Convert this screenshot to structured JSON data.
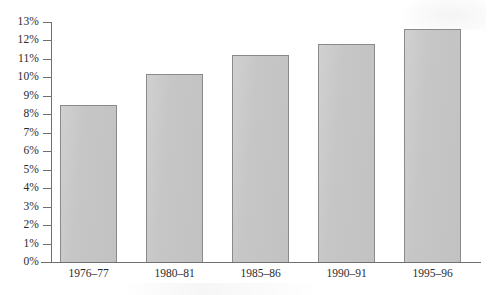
{
  "chart_data": {
    "type": "bar",
    "title": "",
    "subtitle": "",
    "xlabel": "",
    "ylabel": "",
    "categories": [
      "1976–77",
      "1980–81",
      "1985–86",
      "1990–91",
      "1995–96"
    ],
    "values": [
      8.5,
      10.2,
      11.2,
      11.8,
      12.6
    ],
    "value_labels": [
      "",
      "",
      "",
      "",
      ""
    ],
    "ylim": [
      0,
      13
    ],
    "ytick_step": 1,
    "ytick_labels": [
      "0%",
      "1%",
      "2%",
      "3%",
      "4%",
      "5%",
      "6%",
      "7%",
      "8%",
      "9%",
      "10%",
      "11%",
      "12%",
      "13%"
    ],
    "ytick_values": [
      0,
      1,
      2,
      3,
      4,
      5,
      6,
      7,
      8,
      9,
      10,
      11,
      12,
      13
    ],
    "grid": false,
    "legend": false,
    "legend_position": "none",
    "series": [
      {
        "name": "",
        "values": [
          8.5,
          10.2,
          11.2,
          11.8,
          12.6
        ]
      }
    ],
    "colors": {
      "bar_fill": "#c5c5c5",
      "bar_border": "#8a8a8a",
      "axis": "#6f6f6f",
      "text": "#2b2b2b",
      "background": "#ffffff"
    }
  }
}
